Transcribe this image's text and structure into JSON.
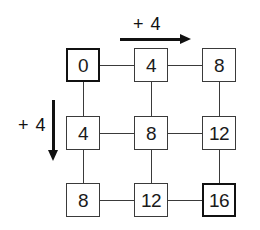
{
  "diagram": {
    "title": "",
    "colors": {
      "background": "#ffffff",
      "line": "#3a3a3a",
      "emphasis_border": "#111111",
      "text": "#1a1a1a"
    },
    "grid": {
      "rows": 3,
      "cols": 3,
      "cells": [
        {
          "id": "r0c0",
          "value": "0",
          "emphasized": true
        },
        {
          "id": "r0c1",
          "value": "4",
          "emphasized": false
        },
        {
          "id": "r0c2",
          "value": "8",
          "emphasized": false
        },
        {
          "id": "r1c0",
          "value": "4",
          "emphasized": false
        },
        {
          "id": "r1c1",
          "value": "8",
          "emphasized": false
        },
        {
          "id": "r1c2",
          "value": "12",
          "emphasized": false
        },
        {
          "id": "r2c0",
          "value": "8",
          "emphasized": false
        },
        {
          "id": "r2c1",
          "value": "12",
          "emphasized": false
        },
        {
          "id": "r2c2",
          "value": "16",
          "emphasized": true
        }
      ]
    },
    "annotations": {
      "horizontal_step": {
        "label": "+ 4",
        "direction": "right",
        "icon": "right-arrow-icon"
      },
      "vertical_step": {
        "label": "+ 4",
        "direction": "down",
        "icon": "down-arrow-icon"
      }
    }
  }
}
